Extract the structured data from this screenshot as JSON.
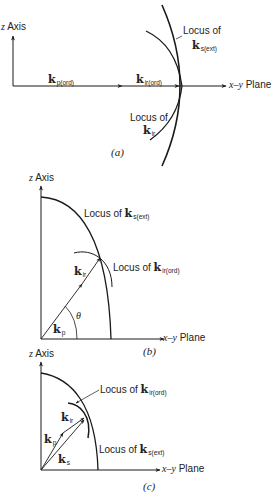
{
  "figure": {
    "panels": [
      {
        "id": "a",
        "caption": "(a)",
        "z_axis_label": "Axis",
        "z_axis_var": "z",
        "plane_var": "x–y",
        "plane_label": "Plane",
        "vectors": [
          {
            "symbol": "k",
            "sub": "p(ord)"
          },
          {
            "symbol": "k",
            "sub": "ir(ord)"
          }
        ],
        "loci": [
          {
            "prefix": "Locus of",
            "symbol": "k",
            "sub": "s(ext)"
          },
          {
            "prefix": "Locus of",
            "symbol": "k",
            "sub": "ir"
          }
        ]
      },
      {
        "id": "b",
        "caption": "(b)",
        "z_axis_label": "Axis",
        "z_axis_var": "z",
        "plane_var": "x–y",
        "plane_label": "Plane",
        "angle": "θ",
        "vectors": [
          {
            "symbol": "k",
            "sub": "p"
          },
          {
            "symbol": "k",
            "sub": "ir"
          }
        ],
        "loci": [
          {
            "prefix": "Locus of",
            "symbol": "k",
            "sub": "s(ext)"
          },
          {
            "prefix": "Locus of",
            "symbol": "k",
            "sub": "ir(ord)"
          }
        ]
      },
      {
        "id": "c",
        "caption": "(c)",
        "z_axis_label": "Axis",
        "z_axis_var": "z",
        "plane_var": "x–y",
        "plane_label": "Plane",
        "vectors": [
          {
            "symbol": "k",
            "sub": "p"
          },
          {
            "symbol": "k",
            "sub": "ir"
          },
          {
            "symbol": "k",
            "sub": "s"
          }
        ],
        "loci": [
          {
            "prefix": "Locus of",
            "symbol": "k",
            "sub": "ir(ord)"
          },
          {
            "prefix": "Locus of",
            "symbol": "k",
            "sub": "s(ext)"
          }
        ]
      }
    ]
  }
}
